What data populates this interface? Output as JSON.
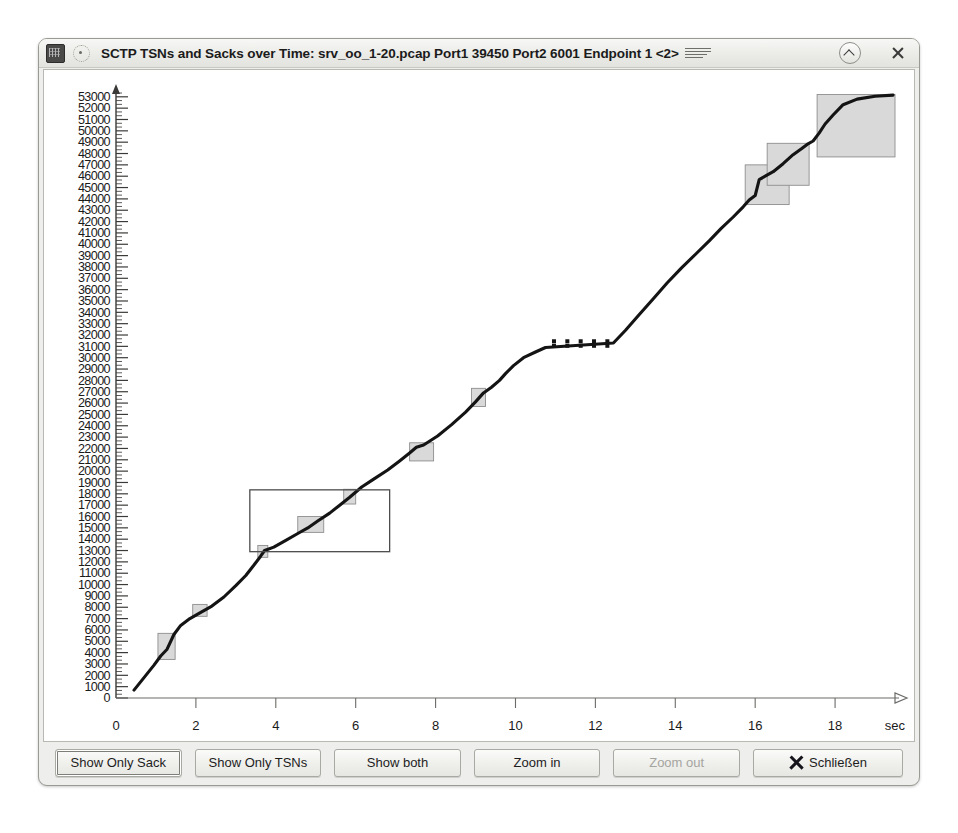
{
  "window": {
    "title": "SCTP TSNs and Sacks over Time: srv_oo_1-20.pcap Port1 39450 Port2 6001 Endpoint 1 <2>",
    "app_icon": "wireshark-icon",
    "menu_dot": "window-menu-icon",
    "title_lines": "title-lines-icon",
    "collapse_label": "collapse-icon",
    "close_label": "close-icon"
  },
  "buttons": [
    {
      "name": "show-only-sack-button",
      "label": "Show Only Sack",
      "state": "focused"
    },
    {
      "name": "show-only-tsns-button",
      "label": "Show Only TSNs",
      "state": "normal"
    },
    {
      "name": "show-both-button",
      "label": "Show both",
      "state": "normal"
    },
    {
      "name": "zoom-in-button",
      "label": "Zoom in",
      "state": "normal"
    },
    {
      "name": "zoom-out-button",
      "label": "Zoom out",
      "state": "disabled"
    },
    {
      "name": "close-dialog-button",
      "label": "Schließen",
      "state": "normal",
      "icon": "close-x-icon"
    }
  ],
  "chart_data": {
    "type": "line",
    "title": "SCTP TSNs and Sacks over Time",
    "xlabel": "sec",
    "ylabel": "",
    "xlim": [
      0,
      19.6
    ],
    "ylim": [
      0,
      53600
    ],
    "grid": false,
    "legend": "none",
    "x_ticks": [
      0,
      2,
      4,
      6,
      8,
      10,
      12,
      14,
      16,
      18
    ],
    "y_ticks": [
      0,
      1000,
      2000,
      3000,
      4000,
      5000,
      6000,
      7000,
      8000,
      9000,
      10000,
      11000,
      12000,
      13000,
      14000,
      15000,
      16000,
      17000,
      18000,
      19000,
      20000,
      21000,
      22000,
      23000,
      24000,
      25000,
      26000,
      27000,
      28000,
      29000,
      30000,
      31000,
      32000,
      33000,
      34000,
      35000,
      36000,
      37000,
      38000,
      39000,
      40000,
      41000,
      42000,
      43000,
      44000,
      45000,
      46000,
      47000,
      48000,
      49000,
      50000,
      51000,
      52000,
      53000
    ],
    "y_minor_ticks_per_major": 2,
    "series": [
      {
        "name": "TSN / Sack cumulative sequence",
        "style": "solid-thick",
        "points": [
          [
            0.45,
            700
          ],
          [
            0.7,
            1800
          ],
          [
            0.95,
            2900
          ],
          [
            1.12,
            3700
          ],
          [
            1.28,
            4300
          ],
          [
            1.45,
            5600
          ],
          [
            1.62,
            6400
          ],
          [
            1.85,
            7000
          ],
          [
            2.1,
            7500
          ],
          [
            2.4,
            8100
          ],
          [
            2.7,
            8900
          ],
          [
            3.0,
            9900
          ],
          [
            3.25,
            10800
          ],
          [
            3.45,
            11700
          ],
          [
            3.62,
            12500
          ],
          [
            3.72,
            13000
          ],
          [
            3.95,
            13300
          ],
          [
            4.25,
            13900
          ],
          [
            4.55,
            14500
          ],
          [
            4.8,
            15000
          ],
          [
            5.05,
            15600
          ],
          [
            5.35,
            16300
          ],
          [
            5.6,
            17000
          ],
          [
            5.85,
            17700
          ],
          [
            6.15,
            18600
          ],
          [
            6.45,
            19300
          ],
          [
            6.8,
            20100
          ],
          [
            7.1,
            20900
          ],
          [
            7.35,
            21600
          ],
          [
            7.52,
            22100
          ],
          [
            7.7,
            22300
          ],
          [
            8.05,
            23100
          ],
          [
            8.4,
            24100
          ],
          [
            8.75,
            25200
          ],
          [
            9.0,
            26100
          ],
          [
            9.2,
            26900
          ],
          [
            9.4,
            27400
          ],
          [
            9.6,
            28000
          ],
          [
            9.75,
            28600
          ],
          [
            9.95,
            29300
          ],
          [
            10.2,
            30000
          ],
          [
            10.5,
            30500
          ],
          [
            10.75,
            30900
          ],
          [
            12.45,
            31300
          ],
          [
            12.75,
            32400
          ],
          [
            13.1,
            33800
          ],
          [
            13.45,
            35200
          ],
          [
            13.8,
            36600
          ],
          [
            14.15,
            37900
          ],
          [
            14.5,
            39100
          ],
          [
            14.85,
            40300
          ],
          [
            15.15,
            41400
          ],
          [
            15.45,
            42400
          ],
          [
            15.7,
            43300
          ],
          [
            15.85,
            43900
          ],
          [
            16.0,
            44300
          ],
          [
            16.1,
            45700
          ],
          [
            16.25,
            46000
          ],
          [
            16.45,
            46400
          ],
          [
            16.7,
            47100
          ],
          [
            16.95,
            47900
          ],
          [
            17.15,
            48400
          ],
          [
            17.3,
            48800
          ],
          [
            17.45,
            49100
          ],
          [
            17.6,
            49800
          ],
          [
            17.75,
            50600
          ],
          [
            17.95,
            51400
          ],
          [
            18.2,
            52300
          ],
          [
            18.55,
            52800
          ],
          [
            19.0,
            53050
          ],
          [
            19.45,
            53150
          ]
        ]
      }
    ],
    "gap_regions": [
      {
        "x0": 1.05,
        "x1": 1.48,
        "y0": 3400,
        "y1": 5700,
        "fill": "#d9d9d9",
        "note": "retransmission block"
      },
      {
        "x0": 1.92,
        "x1": 2.28,
        "y0": 7200,
        "y1": 8250,
        "fill": "#d9d9d9"
      },
      {
        "x0": 3.55,
        "x1": 3.8,
        "y0": 12400,
        "y1": 13450,
        "fill": "#d9d9d9"
      },
      {
        "x0": 4.55,
        "x1": 5.2,
        "y0": 14600,
        "y1": 16000,
        "fill": "#d9d9d9"
      },
      {
        "x0": 5.7,
        "x1": 6.0,
        "y0": 17100,
        "y1": 18400,
        "fill": "#d9d9d9"
      },
      {
        "x0": 7.35,
        "x1": 7.95,
        "y0": 20900,
        "y1": 22500,
        "fill": "#d9d9d9"
      },
      {
        "x0": 8.9,
        "x1": 9.25,
        "y0": 25700,
        "y1": 27300,
        "fill": "#d9d9d9"
      },
      {
        "x0": 15.75,
        "x1": 16.85,
        "y0": 43500,
        "y1": 47000,
        "fill": "#d9d9d9"
      },
      {
        "x0": 16.3,
        "x1": 17.35,
        "y0": 45200,
        "y1": 48900,
        "fill": "#d9d9d9"
      },
      {
        "x0": 17.55,
        "x1": 19.5,
        "y0": 47700,
        "y1": 53200,
        "fill": "#d9d9d9"
      }
    ],
    "dotted_gap": {
      "x0": 10.78,
      "x1": 12.45,
      "rows": [
        31450,
        31050
      ],
      "count": 5,
      "note": "dotted sack markers during idle gap"
    },
    "selection_rect": {
      "x0": 3.35,
      "x1": 6.85,
      "y0": 12900,
      "y1": 18350,
      "stroke": "#4d4d4d",
      "note": "zoom selection rectangle"
    }
  },
  "colors": {
    "window_bg": "#eeeeec",
    "plot_bg": "#ffffff",
    "axis": "#3a3a38",
    "curve": "#141414",
    "gap_fill": "#d9d9d9",
    "gap_stroke": "#8e8e8e"
  }
}
